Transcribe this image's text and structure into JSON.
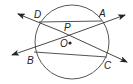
{
  "diagram": {
    "type": "circle-secants",
    "colors": {
      "stroke": "#333333",
      "chord": "#555555",
      "circle": "#444444",
      "background": "#ffffff"
    },
    "circle": {
      "center_label": "O",
      "cx": 72,
      "cy": 42,
      "r": 37
    },
    "points": {
      "D": {
        "label": "D",
        "x": 39,
        "y": 22
      },
      "A": {
        "label": "A",
        "x": 102,
        "y": 21
      },
      "B": {
        "label": "B",
        "x": 34,
        "y": 52
      },
      "C": {
        "label": "C",
        "x": 107,
        "y": 57
      },
      "P": {
        "label": "P",
        "x": 67,
        "y": 33
      },
      "O": {
        "label": "O",
        "x": 70,
        "y": 43
      }
    },
    "lines": [
      {
        "name": "line-DC",
        "through": [
          "D",
          "C"
        ],
        "arrows": "both"
      },
      {
        "name": "line-BA",
        "through": [
          "B",
          "A"
        ],
        "arrows": "both"
      }
    ],
    "chords": [
      {
        "name": "chord-DA",
        "from": "D",
        "to": "A"
      },
      {
        "name": "chord-BC",
        "from": "B",
        "to": "C"
      }
    ],
    "labels": {
      "D": "D",
      "A": "A",
      "P": "P",
      "O": "O",
      "B": "B",
      "C": "C"
    }
  }
}
